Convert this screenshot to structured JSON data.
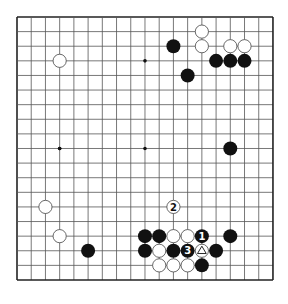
{
  "board": {
    "size": 19,
    "origin": {
      "x": 17,
      "y": 17
    },
    "step": {
      "x": 14.22,
      "y": 14.61
    },
    "stone_radius": 7,
    "line_color": "#555555",
    "border_color": "#222222",
    "star_points": [
      [
        3,
        9
      ],
      [
        9,
        3
      ],
      [
        9,
        9
      ],
      [
        3,
        3
      ],
      [
        15,
        3
      ],
      [
        15,
        9
      ],
      [
        3,
        15
      ],
      [
        9,
        15
      ],
      [
        15,
        15
      ],
      [
        3,
        9
      ]
    ],
    "colors": {
      "black": "#111111",
      "white": "#ffffff",
      "white_outline": "#444444",
      "label_on_black": "#ffffff",
      "label_on_white": "#111111"
    }
  },
  "stones": [
    {
      "color": "white",
      "col": 3,
      "row": 3
    },
    {
      "color": "white",
      "col": 13,
      "row": 1
    },
    {
      "color": "black",
      "col": 11,
      "row": 2
    },
    {
      "color": "white",
      "col": 13,
      "row": 2
    },
    {
      "color": "white",
      "col": 15,
      "row": 2
    },
    {
      "color": "white",
      "col": 16,
      "row": 2
    },
    {
      "color": "black",
      "col": 14,
      "row": 3
    },
    {
      "color": "black",
      "col": 15,
      "row": 3
    },
    {
      "color": "black",
      "col": 16,
      "row": 3
    },
    {
      "color": "black",
      "col": 12,
      "row": 4
    },
    {
      "color": "black",
      "col": 15,
      "row": 9
    },
    {
      "color": "white",
      "col": 2,
      "row": 13
    },
    {
      "color": "white",
      "col": 11,
      "row": 13,
      "label": "2"
    },
    {
      "color": "white",
      "col": 3,
      "row": 15
    },
    {
      "color": "black",
      "col": 9,
      "row": 15
    },
    {
      "color": "black",
      "col": 10,
      "row": 15
    },
    {
      "color": "white",
      "col": 11,
      "row": 15
    },
    {
      "color": "white",
      "col": 12,
      "row": 15
    },
    {
      "color": "black",
      "col": 13,
      "row": 15,
      "label": "1"
    },
    {
      "color": "black",
      "col": 15,
      "row": 15
    },
    {
      "color": "black",
      "col": 5,
      "row": 16
    },
    {
      "color": "black",
      "col": 9,
      "row": 16
    },
    {
      "color": "white",
      "col": 10,
      "row": 16
    },
    {
      "color": "black",
      "col": 11,
      "row": 16
    },
    {
      "color": "black",
      "col": 12,
      "row": 16,
      "label": "3"
    },
    {
      "color": "white",
      "col": 13,
      "row": 16,
      "mark": "triangle"
    },
    {
      "color": "black",
      "col": 14,
      "row": 16
    },
    {
      "color": "white",
      "col": 10,
      "row": 17
    },
    {
      "color": "white",
      "col": 11,
      "row": 17
    },
    {
      "color": "white",
      "col": 12,
      "row": 17
    },
    {
      "color": "black",
      "col": 13,
      "row": 17
    }
  ]
}
